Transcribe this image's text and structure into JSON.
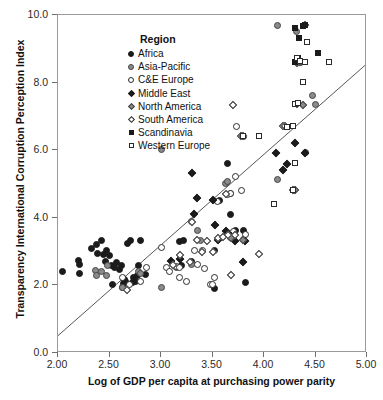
{
  "chart_data": {
    "type": "scatter",
    "title": "",
    "xlabel": "Log of GDP per capita at purchasing power parity",
    "ylabel": "Transparency International Corruption Perception Index",
    "xlim": [
      2.0,
      5.0
    ],
    "ylim": [
      0.0,
      10.0
    ],
    "xticks": [
      "2.00",
      "2.50",
      "3.00",
      "3.50",
      "4.00",
      "4.50",
      "5.00"
    ],
    "xtick_values": [
      2.0,
      2.5,
      3.0,
      3.5,
      4.0,
      4.5,
      5.0
    ],
    "yticks": [
      "0.0",
      "2.0",
      "4.0",
      "6.0",
      "8.0",
      "10.0"
    ],
    "ytick_values": [
      0.0,
      2.0,
      4.0,
      6.0,
      8.0,
      10.0
    ],
    "grid": false,
    "legend_position": "top-left-inside",
    "legend_title": "Region",
    "trendline": {
      "visible": true,
      "x0": 2.0,
      "y0": 0.45,
      "x1": 5.0,
      "y1": 8.5,
      "color": "#555555"
    },
    "series": [
      {
        "name": "Africa",
        "marker": "circle-filled",
        "color": "#1b1b1b",
        "points": [
          [
            1.97,
            2.02
          ],
          [
            2.04,
            2.42
          ],
          [
            2.21,
            2.35
          ],
          [
            2.2,
            2.75
          ],
          [
            2.21,
            2.63
          ],
          [
            2.33,
            3.1
          ],
          [
            2.37,
            3.22
          ],
          [
            2.42,
            3.32
          ],
          [
            2.38,
            2.95
          ],
          [
            2.44,
            2.9
          ],
          [
            2.46,
            2.72
          ],
          [
            2.47,
            3.02
          ],
          [
            2.5,
            2.88
          ],
          [
            2.52,
            2.6
          ],
          [
            2.55,
            2.52
          ],
          [
            2.53,
            2.02
          ],
          [
            2.57,
            2.68
          ],
          [
            2.62,
            2.6
          ],
          [
            2.63,
            1.93
          ],
          [
            2.64,
            2.05
          ],
          [
            2.65,
            2.18
          ],
          [
            2.67,
            3.25
          ],
          [
            2.7,
            3.32
          ],
          [
            2.73,
            2.22
          ],
          [
            2.75,
            2.12
          ],
          [
            2.77,
            2.28
          ],
          [
            2.78,
            2.6
          ],
          [
            2.8,
            3.32
          ],
          [
            2.85,
            2.32
          ],
          [
            2.66,
            2.12
          ],
          [
            2.72,
            2.08
          ],
          [
            2.6,
            2.48
          ],
          [
            3.18,
            3.3
          ],
          [
            3.22,
            3.32
          ],
          [
            3.3,
            2.72
          ],
          [
            3.52,
            3.02
          ],
          [
            3.52,
            1.92
          ],
          [
            3.57,
            4.52
          ],
          [
            3.65,
            5.62
          ],
          [
            3.67,
            4.1
          ],
          [
            3.72,
            3.62
          ],
          [
            3.8,
            3.62
          ],
          [
            3.82,
            2.1
          ],
          [
            3.2,
            2.58
          ]
        ]
      },
      {
        "name": "Asia-Pacific",
        "marker": "circle-gray",
        "color": "#8a8a8a",
        "points": [
          [
            2.36,
            2.45
          ],
          [
            2.37,
            2.3
          ],
          [
            2.42,
            2.42
          ],
          [
            2.48,
            2.6
          ],
          [
            2.63,
            1.95
          ],
          [
            2.78,
            2.4
          ],
          [
            2.8,
            2.35
          ],
          [
            3.0,
            6.02
          ],
          [
            3.0,
            1.93
          ],
          [
            3.15,
            2.52
          ],
          [
            3.3,
            2.62
          ],
          [
            3.35,
            3.62
          ],
          [
            3.38,
            3.32
          ],
          [
            3.63,
            5.02
          ],
          [
            3.65,
            5.08
          ],
          [
            3.67,
            4.72
          ],
          [
            3.67,
            3.42
          ],
          [
            4.13,
            9.7
          ],
          [
            4.13,
            5.12
          ],
          [
            4.32,
            9.5
          ],
          [
            4.33,
            8.72
          ],
          [
            4.35,
            8.58
          ],
          [
            4.47,
            7.62
          ],
          [
            4.5,
            7.35
          ],
          [
            4.4,
            5.92
          ],
          [
            3.8,
            3.35
          ],
          [
            2.47,
            2.28
          ]
        ]
      },
      {
        "name": "C&E Europe",
        "marker": "circle-open",
        "color": "#ffffff",
        "points": [
          [
            2.63,
            2.22
          ],
          [
            2.8,
            2.12
          ],
          [
            2.86,
            2.52
          ],
          [
            3.0,
            3.12
          ],
          [
            3.05,
            2.52
          ],
          [
            3.08,
            2.42
          ],
          [
            3.15,
            2.55
          ],
          [
            3.18,
            2.52
          ],
          [
            3.25,
            2.12
          ],
          [
            3.3,
            3.9
          ],
          [
            3.33,
            3.02
          ],
          [
            3.35,
            2.62
          ],
          [
            3.4,
            3.02
          ],
          [
            3.42,
            2.5
          ],
          [
            3.48,
            2.02
          ],
          [
            3.5,
            2.02
          ],
          [
            3.52,
            2.22
          ],
          [
            3.55,
            4.48
          ],
          [
            3.65,
            4.7
          ],
          [
            3.67,
            4.72
          ],
          [
            3.7,
            3.6
          ],
          [
            3.72,
            5.22
          ],
          [
            3.73,
            6.7
          ],
          [
            3.78,
            4.82
          ],
          [
            3.8,
            6.4
          ],
          [
            3.82,
            3.5
          ],
          [
            3.18,
            2.22
          ],
          [
            2.69,
            2.02
          ]
        ]
      },
      {
        "name": "Middle East",
        "marker": "diamond-filled",
        "color": "#1b1b1b",
        "points": [
          [
            3.1,
            2.72
          ],
          [
            3.3,
            5.32
          ],
          [
            3.32,
            4.1
          ],
          [
            3.35,
            4.6
          ],
          [
            3.5,
            4.52
          ],
          [
            3.52,
            3.78
          ],
          [
            3.55,
            3.35
          ],
          [
            3.63,
            3.62
          ],
          [
            3.68,
            3.45
          ],
          [
            3.72,
            3.3
          ],
          [
            3.8,
            2.7
          ],
          [
            3.82,
            3.32
          ],
          [
            4.18,
            5.4
          ],
          [
            4.22,
            5.58
          ],
          [
            4.12,
            5.92
          ],
          [
            4.3,
            6.2
          ],
          [
            4.4,
            5.92
          ],
          [
            4.35,
            8.62
          ],
          [
            3.18,
            2.78
          ]
        ]
      },
      {
        "name": "North America",
        "marker": "diamond-gray",
        "color": "#8a8a8a",
        "points": [
          [
            3.68,
            3.4
          ],
          [
            4.28,
            4.82
          ],
          [
            4.3,
            4.82
          ],
          [
            4.38,
            7.35
          ],
          [
            4.35,
            8.62
          ],
          [
            4.4,
            9.7
          ],
          [
            4.32,
            8.58
          ],
          [
            3.8,
            3.35
          ]
        ]
      },
      {
        "name": "South America",
        "marker": "diamond-open",
        "color": "#ffffff",
        "points": [
          [
            2.67,
            1.85
          ],
          [
            3.18,
            2.9
          ],
          [
            3.3,
            3.88
          ],
          [
            3.35,
            3.35
          ],
          [
            3.4,
            3.0
          ],
          [
            3.45,
            3.32
          ],
          [
            3.5,
            2.98
          ],
          [
            3.55,
            3.4
          ],
          [
            3.6,
            3.42
          ],
          [
            3.63,
            4.7
          ],
          [
            3.65,
            3.48
          ],
          [
            3.68,
            2.3
          ],
          [
            3.7,
            7.35
          ],
          [
            3.72,
            3.5
          ],
          [
            3.78,
            6.42
          ],
          [
            3.8,
            6.42
          ],
          [
            3.95,
            2.92
          ],
          [
            4.18,
            6.72
          ],
          [
            4.2,
            6.72
          ],
          [
            4.32,
            7.38
          ],
          [
            3.28,
            2.7
          ],
          [
            3.12,
            2.6
          ]
        ]
      },
      {
        "name": "Scandinavia",
        "marker": "square-filled",
        "color": "#1b1b1b",
        "points": [
          [
            4.3,
            9.62
          ],
          [
            4.38,
            9.68
          ],
          [
            4.4,
            9.7
          ],
          [
            4.34,
            9.32
          ],
          [
            4.52,
            8.88
          ],
          [
            4.33,
            8.72
          ],
          [
            4.3,
            8.62
          ]
        ]
      },
      {
        "name": "Western Europe",
        "marker": "square-open",
        "color": "#ffffff",
        "points": [
          [
            4.42,
            9.2
          ],
          [
            4.4,
            8.62
          ],
          [
            4.63,
            8.62
          ],
          [
            4.32,
            8.72
          ],
          [
            4.35,
            8.65
          ],
          [
            4.38,
            8.02
          ],
          [
            4.3,
            7.38
          ],
          [
            4.33,
            7.4
          ],
          [
            4.28,
            6.72
          ],
          [
            4.1,
            4.4
          ],
          [
            4.28,
            4.82
          ],
          [
            4.3,
            5.62
          ],
          [
            3.95,
            6.42
          ],
          [
            3.8,
            6.42
          ],
          [
            4.22,
            6.7
          ]
        ]
      }
    ]
  },
  "legend": {
    "title": "Region",
    "items": [
      {
        "label": "Africa",
        "marker": "circle-filled"
      },
      {
        "label": "Asia-Pacific",
        "marker": "circle-gray"
      },
      {
        "label": "C&E Europe",
        "marker": "circle-open"
      },
      {
        "label": "Middle East",
        "marker": "diamond-filled"
      },
      {
        "label": "North America",
        "marker": "diamond-gray"
      },
      {
        "label": "South America",
        "marker": "diamond-open"
      },
      {
        "label": "Scandinavia",
        "marker": "square-filled"
      },
      {
        "label": "Western Europe",
        "marker": "square-open"
      }
    ]
  }
}
